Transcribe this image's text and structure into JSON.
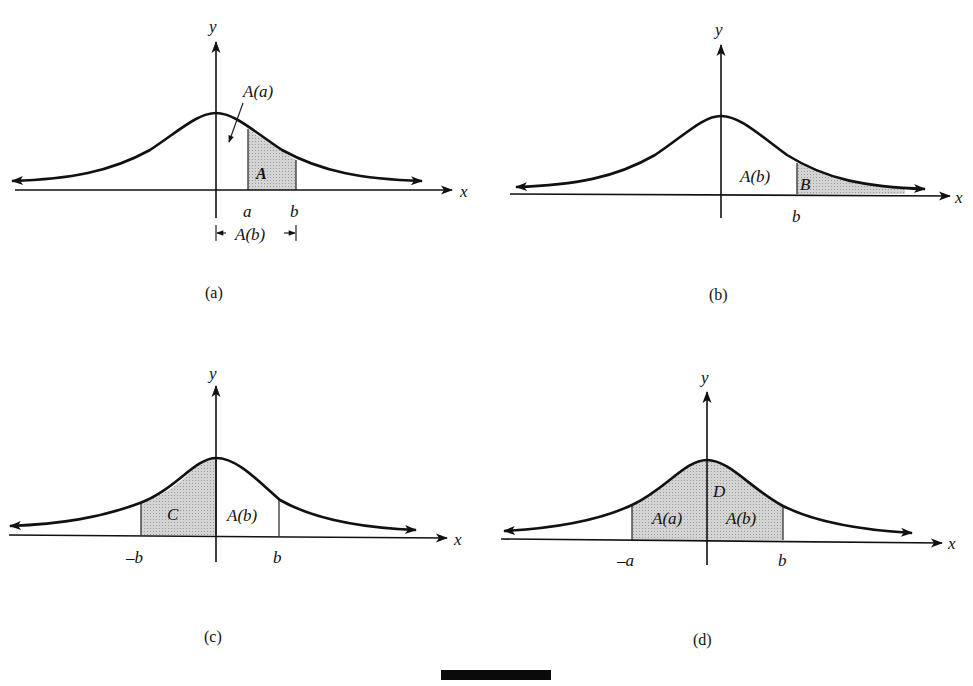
{
  "figure": {
    "colors": {
      "ink": "#111111",
      "shade": "#c8c8c8",
      "background": "#ffffff"
    },
    "panels": [
      {
        "id": "a",
        "caption": "(a)",
        "axis_x": "x",
        "axis_y": "y",
        "tick_labels": [
          "a",
          "b"
        ],
        "region_labels": {
          "shaded": "A",
          "pointer": "A(a)",
          "bracket": "A(b)"
        },
        "shaded_interval": [
          "a",
          "b"
        ]
      },
      {
        "id": "b",
        "caption": "(b)",
        "axis_x": "x",
        "axis_y": "y",
        "tick_labels": [
          "b"
        ],
        "region_labels": {
          "unshaded": "A(b)",
          "shaded": "B"
        },
        "shaded_interval": [
          "b",
          "+inf"
        ]
      },
      {
        "id": "c",
        "caption": "(c)",
        "axis_x": "x",
        "axis_y": "y",
        "tick_labels": [
          "–b",
          "b"
        ],
        "region_labels": {
          "shaded": "C",
          "unshaded": "A(b)"
        },
        "shaded_interval": [
          "-b",
          "0"
        ]
      },
      {
        "id": "d",
        "caption": "(d)",
        "axis_x": "x",
        "axis_y": "y",
        "tick_labels": [
          "–a",
          "b"
        ],
        "region_labels": {
          "shaded": "D",
          "left": "A(a)",
          "right": "A(b)"
        },
        "shaded_interval": [
          "-a",
          "b"
        ]
      }
    ]
  }
}
